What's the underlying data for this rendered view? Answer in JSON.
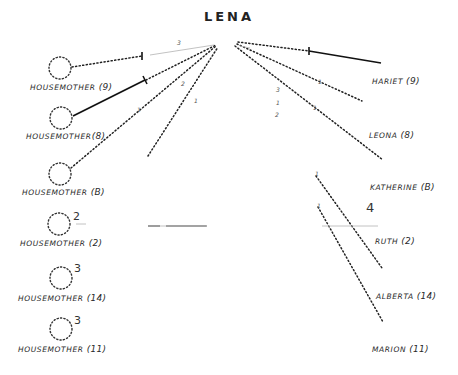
{
  "diagram": {
    "title": "LENA",
    "type": "sociogram",
    "colors": {
      "ink": "#222222",
      "faint": "#bbbbbb",
      "background": "#ffffff"
    },
    "left_nodes": [
      {
        "name": "HOUSEMOTHER",
        "group": "(9)",
        "side_number": ""
      },
      {
        "name": "HOUSEMOTHER",
        "group": "(8)",
        "side_number": ""
      },
      {
        "name": "HOUSEMOTHER",
        "group": "(B)",
        "side_number": ""
      },
      {
        "name": "HOUSEMOTHER",
        "group": "(2)",
        "side_number": "2"
      },
      {
        "name": "HOUSEMOTHER",
        "group": "(14)",
        "side_number": "3"
      },
      {
        "name": "HOUSEMOTHER",
        "group": "(11)",
        "side_number": "3"
      }
    ],
    "right_nodes": [
      {
        "name": "HARIET",
        "group": "(9)"
      },
      {
        "name": "LEONA",
        "group": "(8)"
      },
      {
        "name": "KATHERINE",
        "group": "(B)"
      },
      {
        "name": "RUTH",
        "group": "(2)"
      },
      {
        "name": "ALBERTA",
        "group": "(14)"
      },
      {
        "name": "MARION",
        "group": "(11)"
      }
    ],
    "line_marks": {
      "top_left_3": "3",
      "hm9_tick": "1",
      "center_2": "2",
      "center_1": "1",
      "hm8_tick": "1",
      "hmB_tick": "1",
      "right_3": "3",
      "right_1": "1",
      "right_2": "2",
      "hariet_tick": "1",
      "leona_tick": "1",
      "ruth_mark": "4",
      "katherine_tick": "1",
      "alberta_tick": "1"
    }
  }
}
